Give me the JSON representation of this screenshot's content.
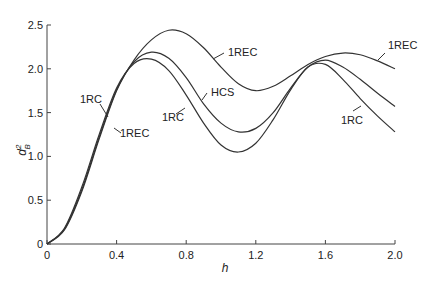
{
  "chart_data": {
    "type": "line",
    "title": "",
    "xlabel": "h",
    "ylabel": "d_B^2",
    "xlim": [
      0,
      2.0
    ],
    "ylim": [
      0,
      2.5
    ],
    "xticks": [
      0,
      0.4,
      0.8,
      1.2,
      1.6,
      2.0
    ],
    "xtick_labels": [
      "0",
      "0.4",
      "0.8",
      "1.2",
      "1.6",
      "2.0"
    ],
    "yticks": [
      0,
      0.5,
      1.0,
      1.5,
      2.0,
      2.5
    ],
    "ytick_labels": [
      "0",
      "0.5",
      "1.0",
      "1.5",
      "2.0",
      "2.5"
    ],
    "grid": false,
    "legend": "inline labels",
    "series": [
      {
        "name": "1REC",
        "x": [
          0,
          0.1,
          0.2,
          0.3,
          0.4,
          0.5,
          0.6,
          0.7,
          0.8,
          0.9,
          1.0,
          1.1,
          1.2,
          1.3,
          1.4,
          1.5,
          1.6,
          1.7,
          1.8,
          1.9,
          2.0
        ],
        "y": [
          0,
          0.16,
          0.6,
          1.2,
          1.75,
          2.1,
          2.33,
          2.44,
          2.4,
          2.24,
          2.02,
          1.83,
          1.75,
          1.8,
          1.92,
          2.05,
          2.14,
          2.18,
          2.16,
          2.09,
          2.0
        ]
      },
      {
        "name": "HCS",
        "x": [
          0,
          0.1,
          0.2,
          0.3,
          0.4,
          0.5,
          0.6,
          0.7,
          0.8,
          0.9,
          1.0,
          1.1,
          1.2,
          1.3,
          1.4,
          1.5,
          1.6,
          1.7,
          1.8,
          1.9,
          2.0
        ],
        "y": [
          0,
          0.17,
          0.62,
          1.22,
          1.76,
          2.08,
          2.19,
          2.12,
          1.9,
          1.6,
          1.38,
          1.28,
          1.32,
          1.5,
          1.78,
          2.02,
          2.1,
          2.02,
          1.88,
          1.72,
          1.57
        ]
      },
      {
        "name": "1RC",
        "x": [
          0,
          0.1,
          0.2,
          0.3,
          0.4,
          0.5,
          0.6,
          0.7,
          0.8,
          0.9,
          1.0,
          1.1,
          1.2,
          1.3,
          1.4,
          1.5,
          1.6,
          1.7,
          1.8,
          1.9,
          2.0
        ],
        "y": [
          0,
          0.18,
          0.65,
          1.25,
          1.78,
          2.06,
          2.11,
          1.98,
          1.7,
          1.38,
          1.13,
          1.05,
          1.15,
          1.42,
          1.76,
          2.02,
          2.05,
          1.88,
          1.66,
          1.46,
          1.28
        ]
      }
    ],
    "annotations": [
      {
        "text": "1REC",
        "near": [
          0.9,
          2.2
        ]
      },
      {
        "text": "HCS",
        "near": [
          0.9,
          1.75
        ]
      },
      {
        "text": "1RC",
        "near": [
          0.7,
          1.45
        ]
      },
      {
        "text": "1RC",
        "near": [
          0.28,
          1.3
        ]
      },
      {
        "text": "1REC",
        "near": [
          0.4,
          0.8
        ]
      },
      {
        "text": "1REC",
        "near": [
          1.85,
          2.25
        ]
      },
      {
        "text": "1RC",
        "near": [
          1.65,
          1.5
        ]
      }
    ]
  },
  "axes": {
    "xlabel": "h",
    "ylabel_base": "d",
    "ylabel_sup": "2",
    "ylabel_sub": "B"
  },
  "labels": {
    "rec_top": "1REC",
    "hcs": "HCS",
    "rc_mid": "1RC",
    "rc_left": "1RC",
    "rec_left": "1REC",
    "rec_right": "1REC",
    "rc_right": "1RC"
  }
}
